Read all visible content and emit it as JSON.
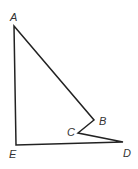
{
  "diagram": {
    "type": "polygon",
    "stroke_color": "#222222",
    "vertices": [
      {
        "name": "A",
        "x": 14,
        "y": 26,
        "label_x": 10,
        "label_y": 21
      },
      {
        "name": "B",
        "x": 94,
        "y": 120,
        "label_x": 99,
        "label_y": 125
      },
      {
        "name": "C",
        "x": 78,
        "y": 133,
        "label_x": 67,
        "label_y": 136
      },
      {
        "name": "D",
        "x": 123,
        "y": 142,
        "label_x": 123,
        "label_y": 157
      },
      {
        "name": "E",
        "x": 16,
        "y": 145,
        "label_x": 9,
        "label_y": 158
      }
    ],
    "edges": [
      [
        "A",
        "B"
      ],
      [
        "B",
        "C"
      ],
      [
        "C",
        "D"
      ],
      [
        "D",
        "E"
      ],
      [
        "E",
        "A"
      ]
    ]
  }
}
